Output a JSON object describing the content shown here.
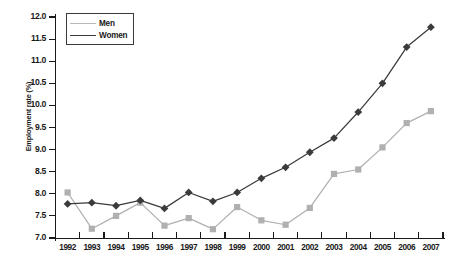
{
  "chart_data": {
    "type": "line",
    "title": "",
    "subtitle": "",
    "xlabel": "",
    "ylabel": "Employment rate (%)",
    "categories": [
      "1992",
      "1993",
      "1994",
      "1995",
      "1996",
      "1997",
      "1998",
      "1999",
      "2000",
      "2001",
      "2002",
      "2003",
      "2004",
      "2005",
      "2006",
      "2007"
    ],
    "x": [
      1992,
      1993,
      1994,
      1995,
      1996,
      1997,
      1998,
      1999,
      2000,
      2001,
      2002,
      2003,
      2004,
      2005,
      2006,
      2007
    ],
    "series": [
      {
        "name": "Men",
        "color": "#b0b0b0",
        "marker": "square",
        "values": [
          8.03,
          7.21,
          7.5,
          7.8,
          7.28,
          7.45,
          7.2,
          7.7,
          7.4,
          7.3,
          7.68,
          8.45,
          8.55,
          9.05,
          9.6,
          9.87
        ]
      },
      {
        "name": "Women",
        "color": "#3b3b3b",
        "marker": "diamond",
        "values": [
          7.77,
          7.8,
          7.73,
          7.85,
          7.67,
          8.03,
          7.83,
          8.03,
          8.35,
          8.6,
          8.94,
          9.26,
          9.85,
          10.5,
          11.32,
          11.77
        ]
      }
    ],
    "ylim": [
      7.0,
      12.0
    ],
    "ytick_values": [
      7.0,
      7.5,
      8.0,
      8.5,
      9.0,
      9.5,
      10.0,
      10.5,
      11.0,
      11.5,
      12.0
    ],
    "ytick_labels": [
      "7.0",
      "7.5",
      "8.0",
      "8.5",
      "9.0",
      "9.5",
      "10.0",
      "10.5",
      "11.0",
      "11.5",
      "12.0"
    ],
    "grid": false,
    "legend_position": "top-left",
    "legend_entries": [
      "Men",
      "Women"
    ]
  },
  "axis": {
    "y_title": "Employment rate (%)"
  },
  "legend": {
    "men_label": "Men",
    "women_label": "Women"
  },
  "colors": {
    "men": "#b0b0b0",
    "women": "#3b3b3b",
    "axis": "#1a1a1a",
    "background": "#ffffff"
  }
}
